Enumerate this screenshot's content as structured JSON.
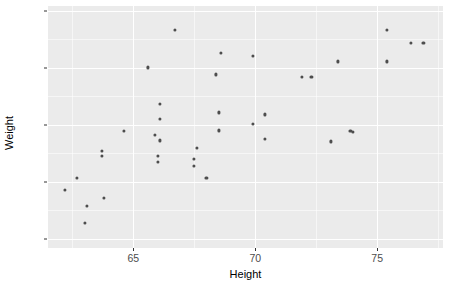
{
  "chart_data": {
    "type": "scatter",
    "title": "",
    "xlabel": "Height",
    "ylabel": "Weight",
    "xlim": [
      61.5,
      77.7
    ],
    "ylim": [
      96,
      202
    ],
    "grid": true,
    "legend": "none",
    "theme": "grey-panel",
    "point_color": "#4d4d4d",
    "panel_color": "#ebebeb",
    "grid_color": "#ffffff",
    "x_ticks": [
      {
        "value": 65,
        "label": "65"
      },
      {
        "value": 70,
        "label": "70"
      },
      {
        "value": 75,
        "label": "75"
      }
    ],
    "x_minor_ticks": [
      62.5,
      67.5,
      72.5,
      77.5
    ],
    "y_ticks": [
      {
        "value": 100,
        "label": "100"
      },
      {
        "value": 125,
        "label": "125"
      },
      {
        "value": 150,
        "label": "150"
      },
      {
        "value": 175,
        "label": "175"
      },
      {
        "value": 200,
        "label": "200"
      }
    ],
    "y_minor_ticks": [
      112.5,
      137.5,
      162.5,
      187.5
    ],
    "n_points": 38,
    "points": [
      {
        "x": 62.2,
        "y": 121.6
      },
      {
        "x": 62.7,
        "y": 126.8
      },
      {
        "x": 63.1,
        "y": 114.5
      },
      {
        "x": 63.0,
        "y": 106.9
      },
      {
        "x": 63.7,
        "y": 138.6
      },
      {
        "x": 63.7,
        "y": 136.4
      },
      {
        "x": 63.8,
        "y": 117.8
      },
      {
        "x": 64.6,
        "y": 147.3
      },
      {
        "x": 65.6,
        "y": 175.1
      },
      {
        "x": 65.9,
        "y": 145.6
      },
      {
        "x": 66.1,
        "y": 159.2
      },
      {
        "x": 66.1,
        "y": 152.7
      },
      {
        "x": 66.1,
        "y": 143.1
      },
      {
        "x": 66.0,
        "y": 136.4
      },
      {
        "x": 66.0,
        "y": 133.8
      },
      {
        "x": 66.7,
        "y": 191.6
      },
      {
        "x": 68.6,
        "y": 181.6
      },
      {
        "x": 68.4,
        "y": 172.0
      },
      {
        "x": 68.5,
        "y": 155.4
      },
      {
        "x": 68.5,
        "y": 147.5
      },
      {
        "x": 67.6,
        "y": 139.9
      },
      {
        "x": 67.5,
        "y": 135.1
      },
      {
        "x": 67.5,
        "y": 132.1
      },
      {
        "x": 68.0,
        "y": 126.8
      },
      {
        "x": 69.9,
        "y": 180.3
      },
      {
        "x": 71.9,
        "y": 171.1
      },
      {
        "x": 70.4,
        "y": 154.5
      },
      {
        "x": 69.9,
        "y": 150.2
      },
      {
        "x": 70.4,
        "y": 143.7
      },
      {
        "x": 75.4,
        "y": 191.6
      },
      {
        "x": 76.4,
        "y": 185.9
      },
      {
        "x": 76.9,
        "y": 185.9
      },
      {
        "x": 73.4,
        "y": 177.7
      },
      {
        "x": 75.4,
        "y": 177.7
      },
      {
        "x": 73.9,
        "y": 147.3
      },
      {
        "x": 74.0,
        "y": 146.9
      },
      {
        "x": 73.1,
        "y": 142.7
      },
      {
        "x": 72.3,
        "y": 171.1
      }
    ]
  }
}
